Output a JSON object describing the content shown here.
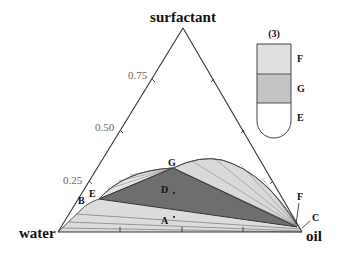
{
  "diagram": {
    "type": "ternary_phase_diagram",
    "vertices": {
      "top": "surfactant",
      "left": "water",
      "right": "oil"
    },
    "left_axis_ticks": [
      "0.25",
      "0.50",
      "0.75"
    ],
    "points": {
      "A": "A",
      "B": "B",
      "C": "C",
      "D": "D",
      "E": "E",
      "F": "F",
      "G": "G"
    },
    "regions": [
      {
        "name": "two-phase lower region (water-rich / oil)",
        "fill": "#dcdcdc"
      },
      {
        "name": "three-phase triangle E-G-F",
        "fill": "#6e6e6e"
      },
      {
        "name": "two-phase left lobe (E-G)",
        "fill": "#e2e2e2"
      },
      {
        "name": "two-phase right lobe (G-F)",
        "fill": "#d8d8d8"
      }
    ],
    "colors": {
      "three_phase": "#6e6e6e",
      "two_phase": "#d9d9d9",
      "outline": "#333333"
    }
  },
  "tube": {
    "title": "(3)",
    "phases": [
      {
        "label": "F",
        "fill": "#e0e0e0"
      },
      {
        "label": "G",
        "fill": "#c4c4c4"
      },
      {
        "label": "E",
        "fill": "#ffffff"
      }
    ]
  }
}
